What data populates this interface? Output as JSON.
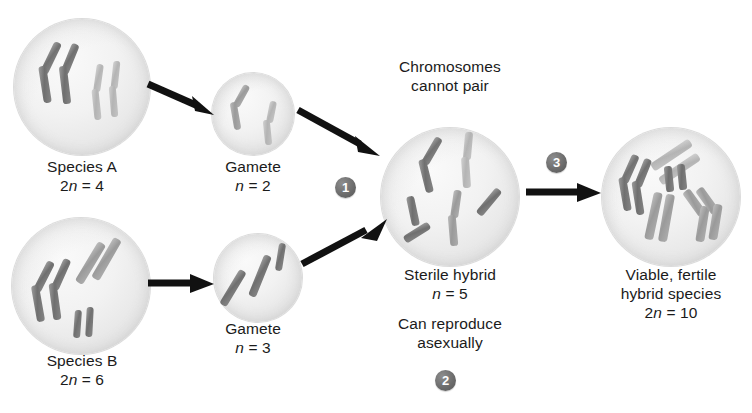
{
  "figure": {
    "background": "#ffffff",
    "accent_badge_color": "#6a6a6a"
  },
  "cells": [
    {
      "id": "species-a",
      "name_label": "Species A",
      "ploidy_prefix": "2",
      "ploidy_symbol": "n",
      "ploidy_value": " = 4",
      "chromosome_count": 4
    },
    {
      "id": "gamete-a",
      "name_label": "Gamete",
      "ploidy_prefix": "",
      "ploidy_symbol": "n",
      "ploidy_value": " = 2",
      "chromosome_count": 2
    },
    {
      "id": "species-b",
      "name_label": "Species B",
      "ploidy_prefix": "2",
      "ploidy_symbol": "n",
      "ploidy_value": " = 6",
      "chromosome_count": 6
    },
    {
      "id": "gamete-b",
      "name_label": "Gamete",
      "ploidy_prefix": "",
      "ploidy_symbol": "n",
      "ploidy_value": " = 3",
      "chromosome_count": 3
    },
    {
      "id": "sterile-hybrid",
      "name_label": "Sterile hybrid",
      "ploidy_prefix": "",
      "ploidy_symbol": "n",
      "ploidy_value": " = 5",
      "chromosome_count": 5
    },
    {
      "id": "viable-hybrid",
      "name_label_line1": "Viable, fertile",
      "name_label_line2": "hybrid species",
      "ploidy_prefix": "2",
      "ploidy_symbol": "n",
      "ploidy_value": " = 10",
      "chromosome_count": 10
    }
  ],
  "annotations": {
    "cannot_pair_line1": "Chromosomes",
    "cannot_pair_line2": "cannot pair",
    "asexual_line1": "Can reproduce",
    "asexual_line2": "asexually"
  },
  "steps": [
    {
      "number": "1"
    },
    {
      "number": "2"
    },
    {
      "number": "3"
    }
  ]
}
